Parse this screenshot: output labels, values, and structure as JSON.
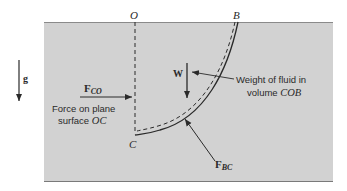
{
  "diagram": {
    "type": "fluid-statics-free-body",
    "colors": {
      "fluid": "#d2d2d2",
      "ink": "#2a2a2a",
      "background": "#ffffff"
    },
    "points": {
      "O": "O",
      "B": "B",
      "C": "C"
    },
    "gravity": {
      "label": "g"
    },
    "forces": {
      "fco": {
        "symbol": "F",
        "subscript": "CO",
        "caption_line1": "Force on plane",
        "caption_line2_prefix": "surface ",
        "caption_line2_italic": "OC"
      },
      "weight": {
        "symbol": "W",
        "caption_line1": "Weight of fluid in",
        "caption_line2_prefix": "volume ",
        "caption_line2_italic": "COB"
      },
      "fbc": {
        "symbol": "F",
        "subscript": "BC"
      }
    }
  }
}
